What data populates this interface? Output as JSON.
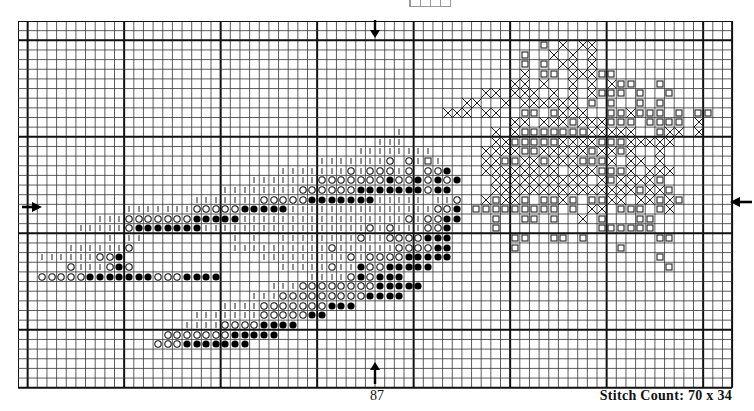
{
  "pattern": {
    "title": "Cross-stitch chart",
    "page_number": "87",
    "stitch_count_label": "Stitch Count: 70 x 34",
    "grid": {
      "cols": 74,
      "rows": 38,
      "cell_px": 9.65,
      "major_every": 10,
      "major_col_offset": 1,
      "major_row_offset": 2,
      "line_color": "#333333",
      "major_line_color": "#111111"
    },
    "symbols": {
      "o": "open-circle",
      "*": "filled-circle",
      "|": "tick",
      "x": "cross",
      "s": "square"
    },
    "center_arrows": [
      {
        "name": "top-center-arrow",
        "dir": "down",
        "x": 375,
        "y": 20
      },
      {
        "name": "bottom-center-arrow",
        "dir": "up",
        "x": 375,
        "y": 362
      },
      {
        "name": "left-center-arrow",
        "dir": "right",
        "x": 22,
        "y": 203
      },
      {
        "name": "right-center-arrow",
        "dir": "left",
        "x": 730,
        "y": 198
      }
    ],
    "rows": [
      "..........................................................................",
      "..........................................................................",
      "......................................................s.x.xx..............",
      "....................................................s..x.x.x..............",
      "....................................................s.s.xx.x..............",
      "....................................................x.ss.xxxss.............",
      "...................................................xx.x..x.x.xss..s........",
      "................................................xx.xxx.x.x.xsss.s..s.......",
      "..............................................xx..x.xxxxxx.s.s..s.s.......",
      "............................................xxx.xx..ss.sxxx..ssxsss.s.ss...",
      "...................................................xx.xxxsxxxsss.ssss.x....",
      ".......................................|.........x.xsssssssxxxxx..sxx.x....",
      ".....................................|||.........xxsssssxxxxsssxxxxx......",
      "...................................||||||||.....xxxxssxxxxxsxxsx..x........",
      "...............................|||||||o.o|s|....xxssxxsxxxsssx.xx.x.......",
      "...........................|||||||o|ooo|o.oo*...xxxxxxxx.xxxsssx.xxx......",
      "........................|||||||ooooooo*oo*o*o*...xxxxxxxxxx.xsxxxxs.......",
      ".....................||||||||oooooo*******o**....xxxxxxxxxxxxxxxsxxs......",
      "..................|||||||ooooo*******|||||.||o..xsxxs.ssxs.ssxx.xxsxs.....",
      "...........|||||||ooooo*****|||||||||||||||oo*.sssssssss.s.xx.sss.sx......",
      "........|||ooooooo*****|||||||||||||||||o|oo**...s..ss.s..x.s...ss.......",
      "......|||||o*******|||||||||||||||||o|o|||oo*....s..........ssssss.......",
      ".........|.||.........|.|..||||||||o||oooo***......ss..ss.s.......ss.....",
      ".....||||||o..........||||||||||o||||||oooo**......s..........s..........",
      "..||||||oo*..............|||||||||o|oooo*****.....................s......",
      ".....o|||o*o...............|||||o||*oo*****........................s.....",
      "..ooooo*******ooo****.........||||o*o***...................................",
      "..........................|||oooooooo*****................................",
      "........................|||ooooooooo****..................................",
      ".....................||||ooooooo***.......................................",
      "..................|||||||ooooo**..........................................",
      ".................||||oooo****...........................................",
      "...............ooooooo*****...............................................",
      "..............ooo*******..................................................",
      "..........................................................................",
      "..........................................................................",
      "..........................................................................",
      ".........................................................................."
    ]
  }
}
